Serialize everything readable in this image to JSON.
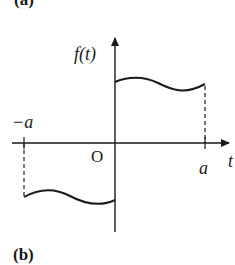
{
  "figure": {
    "panel_top_label": "(a)",
    "panel_bottom_label": "(b)",
    "y_axis_label": "f(t)",
    "x_axis_label": "t",
    "origin_label": "O",
    "neg_tick_label": "−a",
    "pos_tick_label": "a",
    "stroke_color": "#1a1a1a"
  }
}
